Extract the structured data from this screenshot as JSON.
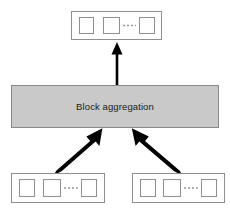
{
  "diagram": {
    "title": "Block aggregation",
    "canvas": {
      "width": 230,
      "height": 210,
      "background": "#ffffff"
    },
    "colors": {
      "aggregation_fill": "#c9c9c9",
      "aggregation_stroke": "#8a8a8a",
      "block_stroke": "#8f8f8f",
      "cell_stroke": "#8f8f8f",
      "arrow_color": "#000000",
      "dashes_color": "#9a9a9a",
      "text_color": "#1a1a1a"
    },
    "aggregation_block": {
      "label": "Block aggregation",
      "x": 11,
      "y": 85,
      "width": 208,
      "height": 43
    },
    "block_groups": [
      {
        "name": "output-block-group",
        "role": "output",
        "x": 71,
        "y": 11,
        "width": 91,
        "height": 29,
        "cells": [
          {
            "name": "cell-1",
            "x": 79,
            "y": 17,
            "width": 15,
            "height": 17
          },
          {
            "name": "cell-2",
            "x": 103,
            "y": 17,
            "width": 17,
            "height": 17
          },
          {
            "name": "cell-n",
            "x": 139,
            "y": 17,
            "width": 16,
            "height": 17
          }
        ],
        "ellipsis": {
          "name": "dashed-continuation",
          "x1": 123,
          "x2": 136,
          "y": 26
        }
      },
      {
        "name": "input-block-group-left",
        "role": "input",
        "x": 11,
        "y": 173,
        "width": 94,
        "height": 30,
        "cells": [
          {
            "name": "cell-1",
            "x": 19,
            "y": 179,
            "width": 16,
            "height": 18
          },
          {
            "name": "cell-2",
            "x": 43,
            "y": 179,
            "width": 18,
            "height": 18
          },
          {
            "name": "cell-n",
            "x": 81,
            "y": 179,
            "width": 16,
            "height": 18
          }
        ],
        "ellipsis": {
          "name": "dashed-continuation",
          "x1": 64,
          "x2": 78,
          "y": 188
        }
      },
      {
        "name": "input-block-group-right",
        "role": "input",
        "x": 132,
        "y": 173,
        "width": 93,
        "height": 30,
        "cells": [
          {
            "name": "cell-1",
            "x": 140,
            "y": 179,
            "width": 16,
            "height": 18
          },
          {
            "name": "cell-2",
            "x": 163,
            "y": 179,
            "width": 18,
            "height": 18
          },
          {
            "name": "cell-n",
            "x": 201,
            "y": 179,
            "width": 16,
            "height": 18
          }
        ],
        "ellipsis": {
          "name": "dashed-continuation",
          "x1": 184,
          "x2": 198,
          "y": 188
        }
      }
    ],
    "arrows": [
      {
        "name": "arrow-aggregation-to-output",
        "direction": "up",
        "from": {
          "x": 117,
          "y": 85
        },
        "to": {
          "x": 117,
          "y": 42
        },
        "shaft_width": 2.6,
        "head_width": 11,
        "head_length": 13
      },
      {
        "name": "arrow-input-left-to-aggregation",
        "direction": "up-right",
        "from": {
          "x": 56,
          "y": 173
        },
        "to": {
          "x": 101,
          "y": 129
        },
        "shaft_width": 3.2,
        "head_width": 13,
        "head_length": 15
      },
      {
        "name": "arrow-input-right-to-aggregation",
        "direction": "up-left",
        "from": {
          "x": 180,
          "y": 173
        },
        "to": {
          "x": 133,
          "y": 129
        },
        "shaft_width": 3.2,
        "head_width": 13,
        "head_length": 15
      }
    ]
  }
}
